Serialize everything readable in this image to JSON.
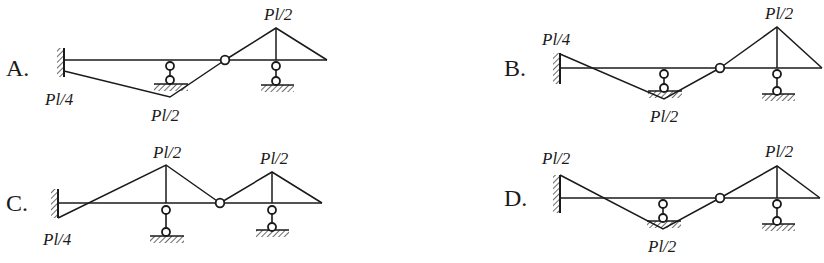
{
  "question": {
    "type": "multiple-choice",
    "options": [
      {
        "key": "A",
        "label": "A.",
        "moment_labels": {
          "fixed_end": "Pl/4",
          "middle_support": "Pl/2",
          "right_support": "Pl/2"
        },
        "fixed_end_side": "below",
        "middle_support_side": "below",
        "right_support_side": "above"
      },
      {
        "key": "B",
        "label": "B.",
        "moment_labels": {
          "fixed_end": "Pl/4",
          "middle_support": "Pl/2",
          "right_support": "Pl/2"
        },
        "fixed_end_side": "above",
        "middle_support_side": "below",
        "right_support_side": "above"
      },
      {
        "key": "C",
        "label": "C.",
        "moment_labels": {
          "fixed_end": "Pl/4",
          "middle_support": "Pl/2",
          "right_support": "Pl/2"
        },
        "fixed_end_side": "below",
        "middle_support_side": "above",
        "right_support_side": "above"
      },
      {
        "key": "D",
        "label": "D.",
        "moment_labels": {
          "fixed_end": "Pl/2",
          "middle_support": "Pl/2",
          "right_support": "Pl/2"
        },
        "fixed_end_side": "above",
        "middle_support_side": "below",
        "right_support_side": "above"
      }
    ]
  },
  "display": {
    "A": {
      "label": "A.",
      "fixed": "Pl/4",
      "mid": "Pl/2",
      "right": "Pl/2"
    },
    "B": {
      "label": "B.",
      "fixed": "Pl/4",
      "mid": "Pl/2",
      "right": "Pl/2"
    },
    "C": {
      "label": "C.",
      "fixed": "Pl/4",
      "mid": "Pl/2",
      "right": "Pl/2"
    },
    "D": {
      "label": "D.",
      "fixed": "Pl/2",
      "mid": "Pl/2",
      "right": "Pl/2"
    }
  },
  "colors": {
    "ink": "#1a1a1a",
    "background": "#ffffff"
  }
}
